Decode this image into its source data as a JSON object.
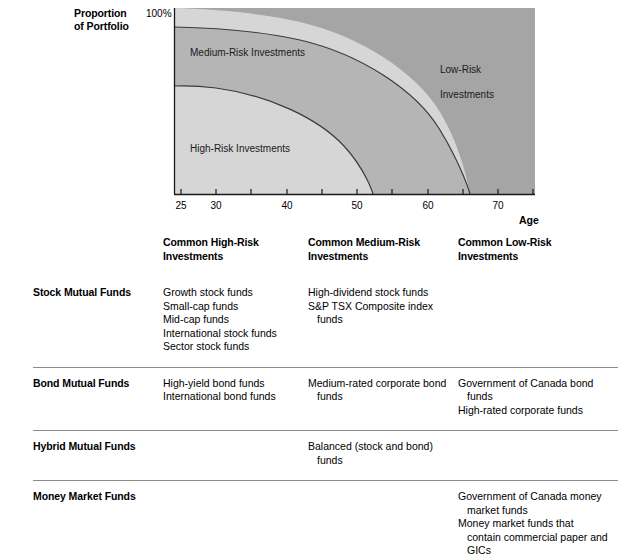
{
  "chart": {
    "y_axis_title_line1": "Proportion",
    "y_axis_title_line2": "of Portfolio",
    "y_max_label": "100%",
    "x_axis_title": "Age",
    "x_tick_labels": [
      "25",
      "30",
      "40",
      "50",
      "60",
      "70"
    ],
    "band_label_medium": "Medium-Risk Investments",
    "band_label_high": "High-Risk Investments",
    "band_label_low_line1": "Low-Risk",
    "band_label_low_line2": "Investments",
    "color_low_risk": "#a5a5a5",
    "color_medium_risk": "#b5b5b5",
    "color_high_risk": "#d6d6d6",
    "color_axis": "#1a1a1a",
    "color_curve": "#3a3a3a"
  },
  "chart_data": {
    "type": "area",
    "title": "",
    "xlabel": "Age",
    "ylabel": "Proportion of Portfolio",
    "xlim": [
      25,
      76
    ],
    "ylim": [
      0,
      100
    ],
    "grid": false,
    "legend": "inline-labels",
    "x_ticks": [
      25,
      30,
      35,
      40,
      45,
      50,
      55,
      60,
      65,
      70,
      75
    ],
    "x_tick_labels": [
      "25",
      "30",
      "",
      "40",
      "",
      "50",
      "",
      "60",
      "",
      "70",
      ""
    ],
    "y_ticks": [
      100
    ],
    "y_tick_labels": [
      "100%"
    ],
    "x": [
      25,
      30,
      35,
      40,
      45,
      50,
      55,
      60,
      62,
      65,
      70,
      73,
      76
    ],
    "series": [
      {
        "name": "High-Risk Investments",
        "values": [
          69,
          68,
          66,
          63,
          58,
          50,
          38,
          14,
          0,
          0,
          0,
          0,
          0
        ]
      },
      {
        "name": "Medium-Risk Investments",
        "values": [
          31,
          31,
          32,
          33,
          35,
          37,
          41,
          48,
          49,
          40,
          16,
          0,
          0
        ]
      },
      {
        "name": "Low-Risk Investments",
        "values": [
          0,
          1,
          2,
          4,
          7,
          13,
          21,
          38,
          51,
          60,
          84,
          100,
          100
        ]
      }
    ],
    "annotations": [
      {
        "text": "Medium-Risk Investments",
        "x": 31,
        "y": 80
      },
      {
        "text": "High-Risk Investments",
        "x": 31,
        "y": 32
      },
      {
        "text": "Low-Risk Investments",
        "x": 62,
        "y": 78
      }
    ]
  },
  "table": {
    "headers": [
      "",
      "Common High-Risk\nInvestments",
      "Common Medium-Risk\nInvestments",
      "Common Low-Risk\nInvestments"
    ],
    "header_col0": "",
    "header_col1_line1": "Common High-Risk",
    "header_col1_line2": "Investments",
    "header_col2_line1": "Common Medium-Risk",
    "header_col2_line2": "Investments",
    "header_col3_line1": "Common Low-Risk",
    "header_col3_line2": "Investments",
    "rows": [
      {
        "label": "Stock Mutual Funds",
        "high_risk": [
          "Growth stock funds",
          "Small-cap funds",
          "Mid-cap funds",
          "International stock funds",
          "Sector stock funds"
        ],
        "medium_risk": [
          "High-dividend stock funds",
          "S&P TSX Composite index funds"
        ],
        "low_risk": []
      },
      {
        "label": "Bond Mutual Funds",
        "high_risk": [
          "High-yield bond funds",
          "International bond funds"
        ],
        "medium_risk": [
          "Medium-rated corporate bond funds"
        ],
        "low_risk": [
          "Government of Canada bond funds",
          "High-rated corporate funds"
        ]
      },
      {
        "label": "Hybrid Mutual Funds",
        "high_risk": [],
        "medium_risk": [
          "Balanced (stock and bond) funds"
        ],
        "low_risk": []
      },
      {
        "label": "Money Market Funds",
        "high_risk": [],
        "medium_risk": [],
        "low_risk": [
          "Government of Canada money market funds",
          "Money market funds that contain commercial paper and GICs"
        ]
      }
    ]
  }
}
